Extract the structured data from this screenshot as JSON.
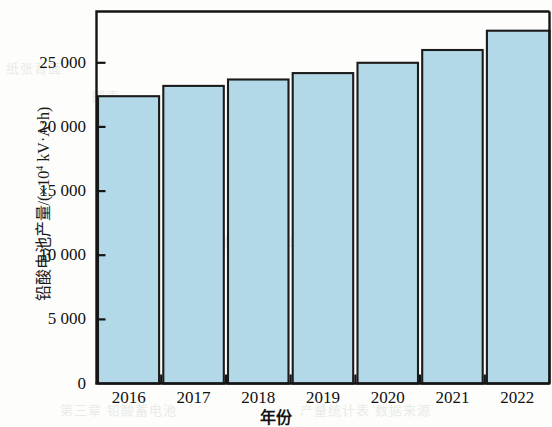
{
  "chart_data": {
    "type": "bar",
    "title": "",
    "xlabel": "年份",
    "ylabel": "铅酸电池产量/(×10⁴ kV·A·h)",
    "ylabel_parts": {
      "main": "铅酸电池产量/(×10",
      "sup": "4",
      "tail": " kV·A·h)"
    },
    "categories": [
      "2016",
      "2017",
      "2018",
      "2019",
      "2020",
      "2021",
      "2022"
    ],
    "values": [
      22400,
      23200,
      23700,
      24200,
      25000,
      26000,
      27500
    ],
    "ylim": [
      0,
      29000
    ],
    "yticks": [
      0,
      5000,
      10000,
      15000,
      20000,
      25000
    ],
    "ytick_labels": [
      "0",
      "5 000",
      "10 000",
      "15 000",
      "20 000",
      "25 000"
    ],
    "grid": false,
    "legend": null,
    "bar_color": "#b3d8e8",
    "bar_edge_color": "#1b1b1b",
    "axis_color": "#141414",
    "background": "#fdfdfb"
  },
  "ghost_text": {
    "g1": "纸张背面",
    "g2": "图表",
    "g3": "第三章 铅酸蓄电池",
    "g4": "产量统计表 数据来源",
    "g5": "铅酸蓄电池 年度产量",
    "g6": "附录"
  }
}
